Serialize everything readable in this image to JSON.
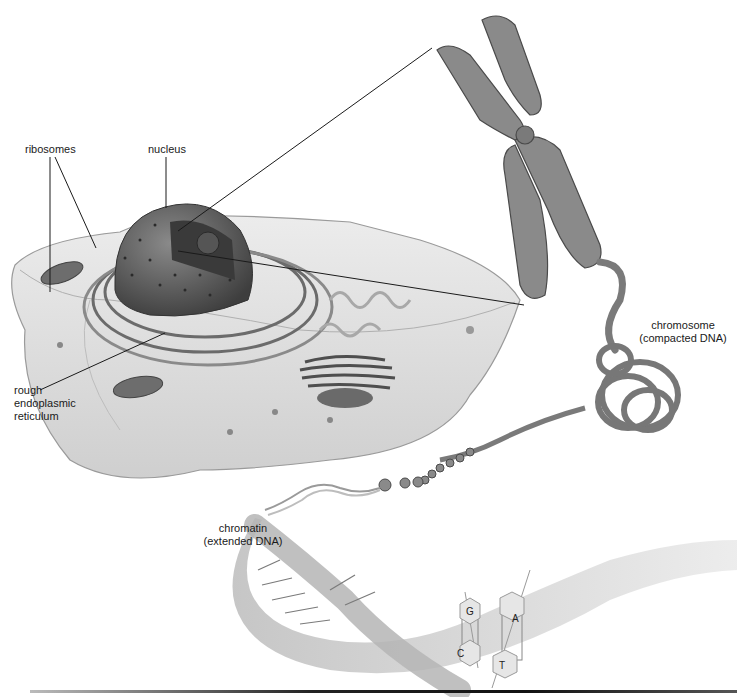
{
  "figure": {
    "colors": {
      "background": "#ffffff",
      "cell_body": "#d9d9d9",
      "cell_edge": "#9a9a9a",
      "nucleus": "#5e5e5e",
      "organelle": "#6a6a6a",
      "chromosome": "#8a8a8a",
      "dna_strand": "#c4c4c4",
      "leader_line": "#1a1a1a",
      "label_text": "#1a1a1a"
    }
  },
  "labels": {
    "ribosomes": "ribosomes",
    "nucleus": "nucleus",
    "rough_er_line1": "rough",
    "rough_er_line2": "endoplasmic",
    "rough_er_line3": "reticulum",
    "chromosome_line1": "chromosome",
    "chromosome_line2": "(compacted DNA)",
    "chromatin_line1": "chromatin",
    "chromatin_line2": "(extended DNA)"
  },
  "base_pairs": [
    {
      "top": "G",
      "bottom": "C"
    },
    {
      "top": "A",
      "bottom": "T"
    }
  ]
}
